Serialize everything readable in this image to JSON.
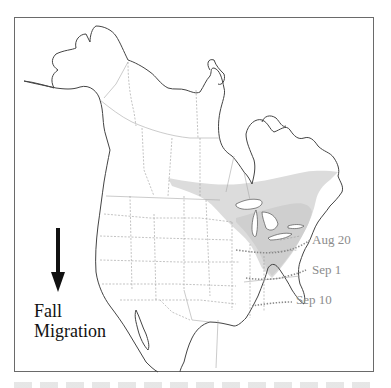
{
  "map": {
    "region": "North America",
    "legend": {
      "direction_icon": "arrow-down-icon",
      "title_line1": "Fall",
      "title_line2": "Migration"
    },
    "isochrones": [
      {
        "label": "Aug 20"
      },
      {
        "label": "Sep 1"
      },
      {
        "label": "Sep 10"
      }
    ],
    "colors": {
      "range_fill": "#dcdcdc",
      "coastline": "#444444",
      "borders": "#9a9a9a",
      "isochrone_line": "#8a8a8a",
      "date_label": "#8c8c8c",
      "title_text": "#111111"
    }
  }
}
